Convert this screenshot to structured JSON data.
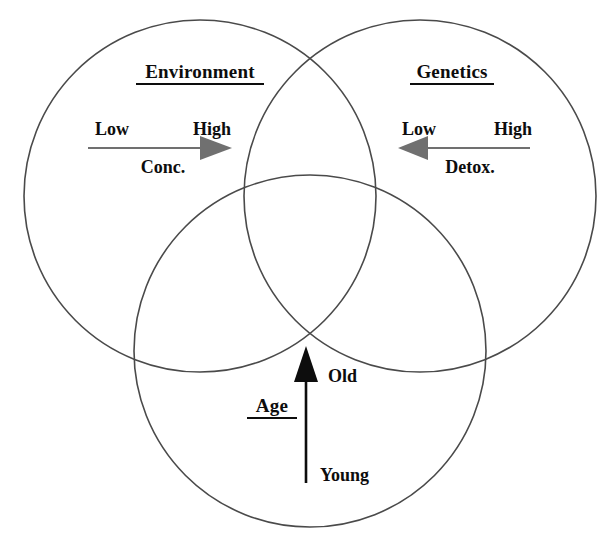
{
  "diagram": {
    "type": "venn-three-circle",
    "background_color": "#ffffff",
    "circle_stroke_color": "#4a4a4a",
    "text_color": "#0d0d0d",
    "gray_arrow_color": "#707070",
    "black_arrow_color": "#0d0d0d",
    "circles": [
      {
        "id": "environment",
        "title": "Environment",
        "position": "top-left",
        "cx": 200,
        "cy": 196,
        "r": 176
      },
      {
        "id": "genetics",
        "title": "Genetics",
        "position": "top-right",
        "cx": 420,
        "cy": 196,
        "r": 176
      },
      {
        "id": "age",
        "title": "Age",
        "position": "bottom-center",
        "cx": 310,
        "cy": 351,
        "r": 176
      }
    ],
    "axes": [
      {
        "id": "conc",
        "belongs_to": "environment",
        "axis_name": "Conc.",
        "low_label": "Low",
        "high_label": "High",
        "direction": "right",
        "arrow_color": "#707070",
        "meaning": "Concentration increases from Low to High"
      },
      {
        "id": "detox",
        "belongs_to": "genetics",
        "axis_name": "Detox.",
        "low_label": "Low",
        "high_label": "High",
        "direction": "left",
        "arrow_color": "#707070",
        "meaning": "Detoxification decreases from High to Low"
      },
      {
        "id": "age-axis",
        "belongs_to": "age",
        "axis_name": "Age",
        "low_label": "Young",
        "high_label": "Old",
        "direction": "up",
        "arrow_color": "#0d0d0d",
        "meaning": "Age increases from Young to Old"
      }
    ]
  }
}
